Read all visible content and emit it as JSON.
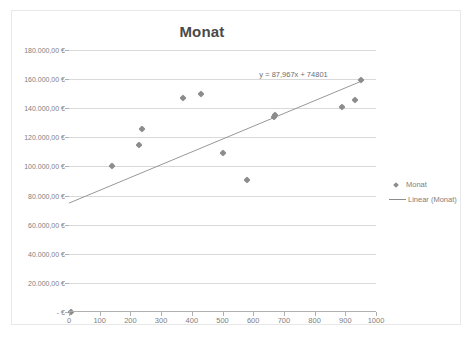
{
  "chart_data": {
    "type": "scatter",
    "title": "Monat",
    "xlabel": "",
    "ylabel": "",
    "xlim": [
      0,
      1000
    ],
    "ylim": [
      0,
      180000
    ],
    "grid": true,
    "legend_position": "right",
    "x_ticks": [
      "0",
      "100",
      "200",
      "300",
      "400",
      "500",
      "600",
      "700",
      "800",
      "900",
      "1000"
    ],
    "x_tick_values": [
      0,
      100,
      200,
      300,
      400,
      500,
      600,
      700,
      800,
      900,
      1000
    ],
    "y_ticks": [
      "-   €",
      "20.000,00 €",
      "40.000,00 €",
      "60.000,00 €",
      "80.000,00 €",
      "100.000,00 €",
      "120.000,00 €",
      "140.000,00 €",
      "160.000,00 €",
      "180.000,00 €"
    ],
    "y_tick_values": [
      0,
      20000,
      40000,
      60000,
      80000,
      100000,
      120000,
      140000,
      160000,
      180000
    ],
    "series": [
      {
        "name": "Monat",
        "marker": "diamond",
        "color": "#8c8c8c",
        "points": [
          {
            "x": 5,
            "y": 0
          },
          {
            "x": 140,
            "y": 100000
          },
          {
            "x": 228,
            "y": 115000
          },
          {
            "x": 238,
            "y": 126000
          },
          {
            "x": 370,
            "y": 147000
          },
          {
            "x": 430,
            "y": 150000
          },
          {
            "x": 500,
            "y": 109000
          },
          {
            "x": 580,
            "y": 90500
          },
          {
            "x": 668,
            "y": 134000
          },
          {
            "x": 672,
            "y": 135500
          },
          {
            "x": 890,
            "y": 141000
          },
          {
            "x": 930,
            "y": 145500
          },
          {
            "x": 952,
            "y": 159500
          }
        ]
      }
    ],
    "trendline": {
      "name": "Linear (Monat)",
      "type": "linear",
      "slope": 87.967,
      "intercept": 74801,
      "equation": "y = 87,967x + 74801",
      "color": "#8c8c8c",
      "x_start": 0,
      "x_end": 960
    },
    "legend_entries": [
      {
        "label": "Monat",
        "marker": "diamond"
      },
      {
        "label": "Linear (Monat)",
        "marker": "line"
      }
    ]
  }
}
